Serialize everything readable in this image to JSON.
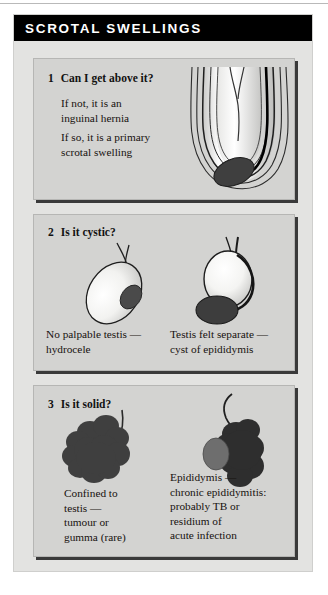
{
  "header": {
    "title": "SCROTAL SWELLINGS"
  },
  "colors": {
    "header_bg": "#000000",
    "header_text": "#ffffff",
    "card_bg": "#e3e3e1",
    "panel_bg": "#d3d3d1",
    "panel_shadow": "#3a3a3a",
    "dark_mass": "#3a3a3a",
    "mid_gray": "#6e6e6e",
    "outline": "#1a1a1a"
  },
  "panels": [
    {
      "number": "1",
      "question": "Can I get above it?",
      "lines": [
        "If not, it is an\ninguinal hernia",
        "If so, it is a primary\nscrotal swelling"
      ],
      "figure": "scrotum-layers-with-testis"
    },
    {
      "number": "2",
      "question": "Is it cystic?",
      "captions": [
        "No palpable testis —\nhydrocele",
        "Testis felt separate —\ncyst of epididymis"
      ],
      "figures": [
        "hydrocele-oval-with-testis",
        "cyst-above-separate-testis"
      ]
    },
    {
      "number": "3",
      "question": "Is it solid?",
      "captions": [
        "Confined to\ntestis —\ntumour or\ngumma (rare)",
        "Epididymis —\nchronic epididymitis:\nprobably TB or\nresidium of\nacute infection"
      ],
      "figures": [
        "solid-lumpy-testis-mass",
        "lumpy-epididymal-mass-with-testis"
      ]
    }
  ]
}
